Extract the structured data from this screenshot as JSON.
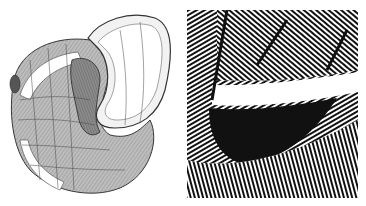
{
  "figure": {
    "panels": [
      {
        "id": "left",
        "description": "Engraving of a coiled snail shell (planispiral, uncoiling aperture) with banded whorls"
      },
      {
        "id": "right",
        "description": "Magnified detail of engraved hatching lines around the shell aperture/umbilicus"
      }
    ],
    "colors": {
      "ink": "#111111",
      "paper": "#ffffff",
      "shade": "#9a9a9a"
    }
  }
}
